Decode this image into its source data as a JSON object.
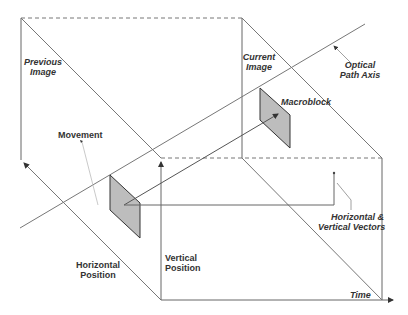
{
  "diagram": {
    "type": "motion-estimation-3d",
    "labels": {
      "previous_image": [
        "Previous",
        "Image"
      ],
      "current_image": [
        "Current",
        "Image"
      ],
      "optical_path_axis": [
        "Optical",
        "Path Axis"
      ],
      "macroblock": "Macroblock",
      "movement": "Movement",
      "hv_vectors": [
        "Horizontal &",
        "Vertical Vectors"
      ],
      "horizontal_position": [
        "Horizontal",
        "Position"
      ],
      "vertical_position": [
        "Vertical",
        "Position"
      ],
      "time": "Time"
    },
    "colors": {
      "line": "#555555",
      "dashed": "#777777",
      "block_fill": "#bdbdbd",
      "block_stroke": "#333333",
      "text": "#333333"
    }
  }
}
